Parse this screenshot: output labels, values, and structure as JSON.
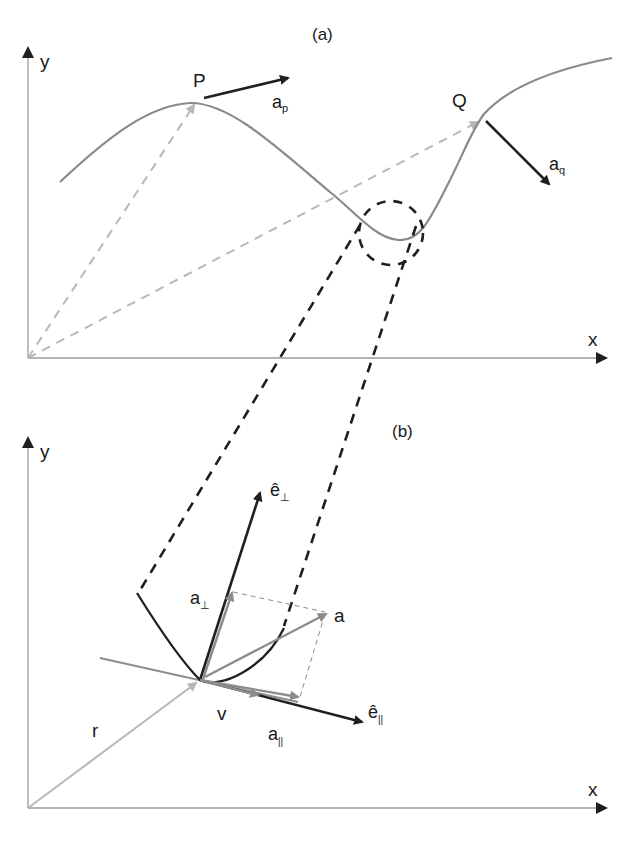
{
  "figure": {
    "panel_a": {
      "label": "(a)",
      "axis_x": "x",
      "axis_y": "y",
      "point_p": "P",
      "point_q": "Q",
      "vec_ap_main": "a",
      "vec_ap_sub": "p",
      "vec_aq_main": "a",
      "vec_aq_sub": "q"
    },
    "panel_b": {
      "label": "(b)",
      "axis_x": "x",
      "axis_y": "y",
      "e_perp_main": "ê",
      "e_perp_sub": "⊥",
      "a_perp_main": "a",
      "a_perp_sub": "⊥",
      "a_label": "a",
      "v_label": "v",
      "r_label": "r",
      "a_par_main": "a",
      "a_par_sub": "||",
      "e_par_main": "ê",
      "e_par_sub": "||"
    },
    "colors": {
      "curve": "#8a8a8a",
      "dark": "#1f1f1f",
      "light_dash": "#b8b8b8",
      "vector_gray": "#8c8c8c",
      "axis": "#9a9a9a"
    }
  }
}
